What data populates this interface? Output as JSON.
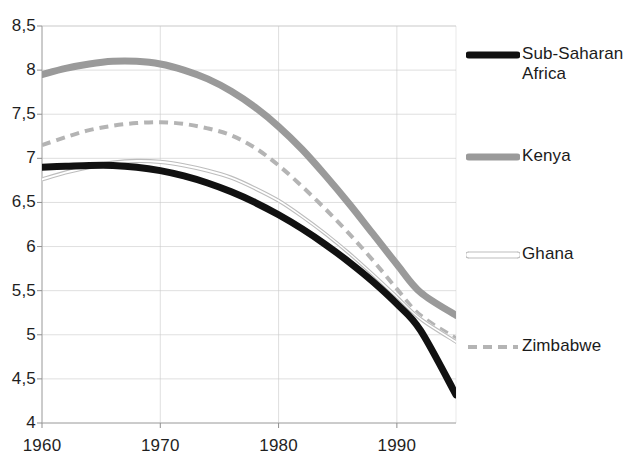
{
  "chart_data": {
    "type": "line",
    "title": "",
    "subtitle": "",
    "xlabel": "",
    "ylabel": "",
    "xlim": [
      1960,
      1995
    ],
    "ylim": [
      4,
      8.5
    ],
    "xticks": [
      "1960",
      "1970",
      "1980",
      "1990"
    ],
    "xtick_values": [
      1960,
      1970,
      1980,
      1990
    ],
    "yticks": [
      "4",
      "4,5",
      "5",
      "5,5",
      "6",
      "6,5",
      "7",
      "7,5",
      "8",
      "8,5"
    ],
    "ytick_values": [
      4,
      4.5,
      5,
      5.5,
      6,
      6.5,
      7,
      7.5,
      8,
      8.5
    ],
    "grid": true,
    "grid_color": "#c9c9c9",
    "legend_position": "right",
    "x": [
      1960,
      1962,
      1964,
      1966,
      1968,
      1970,
      1972,
      1974,
      1976,
      1978,
      1980,
      1982,
      1984,
      1986,
      1988,
      1990,
      1992,
      1995
    ],
    "series": [
      {
        "name": "Sub-Saharan Africa",
        "color": "#111111",
        "style": "solid",
        "width": 7,
        "values": [
          6.9,
          6.91,
          6.92,
          6.92,
          6.9,
          6.86,
          6.8,
          6.72,
          6.62,
          6.5,
          6.36,
          6.2,
          6.02,
          5.82,
          5.6,
          5.35,
          5.05,
          4.32
        ]
      },
      {
        "name": "Kenya",
        "color": "#9a9a9a",
        "style": "solid",
        "width": 7,
        "values": [
          7.95,
          8.02,
          8.07,
          8.1,
          8.1,
          8.07,
          8.0,
          7.9,
          7.76,
          7.58,
          7.36,
          7.1,
          6.8,
          6.48,
          6.14,
          5.8,
          5.48,
          5.22
        ]
      },
      {
        "name": "Ghana",
        "color": "#bdbdbd",
        "style": "outline",
        "width": 4,
        "values": [
          6.76,
          6.84,
          6.9,
          6.95,
          6.97,
          6.96,
          6.92,
          6.86,
          6.78,
          6.66,
          6.52,
          6.34,
          6.14,
          5.92,
          5.68,
          5.43,
          5.18,
          4.92
        ]
      },
      {
        "name": "Zimbabwe",
        "color": "#b4b4b4",
        "style": "dashed",
        "width": 4,
        "values": [
          7.15,
          7.24,
          7.32,
          7.37,
          7.4,
          7.41,
          7.39,
          7.34,
          7.26,
          7.12,
          6.92,
          6.68,
          6.42,
          6.14,
          5.84,
          5.52,
          5.22,
          4.96
        ]
      }
    ]
  },
  "legend": {
    "items": [
      {
        "label": "Sub-Saharan\nAfrica",
        "swatch": "thick-black-line",
        "y": 44
      },
      {
        "label": "Kenya",
        "swatch": "thick-gray-line",
        "y": 146
      },
      {
        "label": "Ghana",
        "swatch": "thin-outline-line",
        "y": 244
      },
      {
        "label": "Zimbabwe",
        "swatch": "gray-dashed-line",
        "y": 336
      }
    ]
  },
  "axes": {
    "y_tick_positions": [
      423,
      380,
      337,
      293,
      250,
      206,
      163,
      119,
      76,
      32
    ],
    "x_tick_positions": [
      42,
      158,
      274,
      390
    ]
  }
}
